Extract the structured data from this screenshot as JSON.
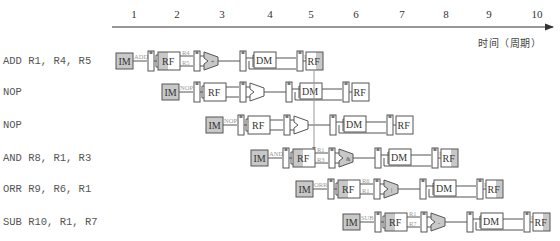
{
  "timeline": {
    "cycles": [
      "1",
      "2",
      "3",
      "4",
      "5",
      "6",
      "7",
      "8",
      "9",
      "10"
    ],
    "cycle_x": [
      134,
      177,
      222,
      270,
      311,
      356,
      402,
      446,
      489,
      537
    ],
    "axis_caption": "时间（周期）"
  },
  "stages": {
    "fetch": "IM",
    "decode": "RF",
    "memory": "DM",
    "writeback": "RF"
  },
  "instructions": [
    {
      "text": "ADD R1, R4, R5",
      "opcode": "ADD",
      "src1": "R4",
      "src2": "R5",
      "dest": "R1",
      "alu_symbol": "+",
      "start_x": 116,
      "y": 61
    },
    {
      "text": "NOP",
      "opcode": "NOP",
      "src1": "",
      "src2": "",
      "dest": "",
      "alu_symbol": "",
      "start_x": 162,
      "y": 92
    },
    {
      "text": "NOP",
      "opcode": "NOP",
      "src1": "",
      "src2": "",
      "dest": "",
      "alu_symbol": "",
      "start_x": 206,
      "y": 125
    },
    {
      "text": "AND R8, R1, R3",
      "opcode": "AND",
      "src1": "R1",
      "src2": "R3",
      "dest": "R8",
      "alu_symbol": "&",
      "start_x": 251,
      "y": 158
    },
    {
      "text": "ORR R9, R6, R1",
      "opcode": "ORR",
      "src1": "R6",
      "src2": "R1",
      "dest": "R9",
      "alu_symbol": "|",
      "start_x": 296,
      "y": 189
    },
    {
      "text": "SUB R10, R1, R7",
      "opcode": "SUB",
      "src1": "R1",
      "src2": "R7",
      "dest": "R10",
      "alu_symbol": "-",
      "start_x": 343,
      "y": 222
    }
  ],
  "hazard": {
    "description": "R1 written back in cycle 5, read by AND in cycle 5",
    "from_row": 0,
    "to_row": 3
  },
  "colors": {
    "stage_fill_active": "#c8c8c8",
    "stage_fill_idle": "#ffffff",
    "line": "#555555",
    "label_text": "#999999",
    "hazard_line": "#999999"
  }
}
